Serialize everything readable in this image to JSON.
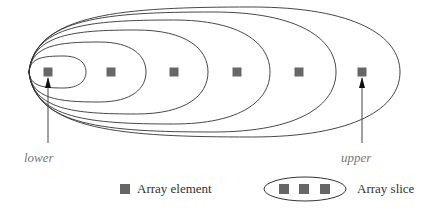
{
  "diagram": {
    "elements": {
      "count": 6,
      "color": "#666666",
      "centers_x": [
        48,
        111,
        174,
        237,
        299,
        362
      ],
      "center_y": 72,
      "size": 9
    },
    "slices": {
      "apex_x": 29,
      "center_y": 72,
      "right_edges": [
        86,
        146,
        208,
        270,
        336,
        400
      ],
      "half_heights": [
        16,
        30,
        42,
        52,
        60,
        65
      ],
      "stroke": "#333333"
    },
    "pointers": {
      "lower": {
        "label": "lower",
        "x": 48
      },
      "upper": {
        "label": "upper",
        "x": 362
      }
    }
  },
  "legend": {
    "element_label": "Array element",
    "slice_label": "Array slice"
  }
}
